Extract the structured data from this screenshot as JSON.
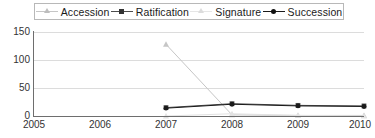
{
  "chart_data": {
    "type": "line",
    "title": "",
    "xlabel": "",
    "ylabel": "",
    "x": [
      2005,
      2006,
      2007,
      2008,
      2009,
      2010
    ],
    "categories": [
      "2005",
      "2006",
      "2007",
      "2008",
      "2009",
      "2010"
    ],
    "xlim": [
      2005,
      2010
    ],
    "ylim": [
      0,
      150
    ],
    "yticks": [
      0,
      50,
      100,
      150
    ],
    "grid": true,
    "legend_position": "top",
    "series": [
      {
        "name": "Accession",
        "color": "#c6c6c6",
        "marker": "triangle",
        "x": [
          2007,
          2008,
          2009,
          2010
        ],
        "values": [
          128,
          2,
          1,
          1
        ]
      },
      {
        "name": "Ratification",
        "color": "#4d4d4d",
        "marker": "square",
        "x": [
          2007,
          2008,
          2009,
          2010
        ],
        "values": [
          15,
          22,
          19,
          18
        ]
      },
      {
        "name": "Signature",
        "color": "#e2e2e2",
        "marker": "triangle",
        "x": [
          2007,
          2008,
          2009,
          2010
        ],
        "values": [
          0,
          4,
          1,
          0
        ]
      },
      {
        "name": "Succession",
        "color": "#1a1a1a",
        "marker": "circle",
        "x": [
          2007,
          2008,
          2009,
          2010
        ],
        "values": [
          14,
          21,
          18,
          17
        ]
      }
    ]
  },
  "legend": {
    "items": [
      {
        "label": "Accession"
      },
      {
        "label": "Ratification"
      },
      {
        "label": "Signature"
      },
      {
        "label": "Succession"
      }
    ]
  },
  "axes": {
    "y_tick_labels": [
      "150",
      "100",
      "50",
      "0"
    ],
    "x_tick_labels": [
      "2005",
      "2006",
      "2007",
      "2008",
      "2009",
      "2010"
    ]
  }
}
